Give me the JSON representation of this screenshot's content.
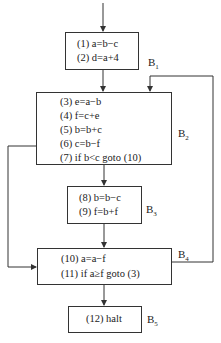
{
  "diagram": {
    "type": "control-flow-graph",
    "blocks": [
      {
        "id": "B1",
        "label": "B",
        "sub": "1",
        "statements": [
          "(1) a=b−c",
          "(2) d=a+4"
        ]
      },
      {
        "id": "B2",
        "label": "B",
        "sub": "2",
        "statements": [
          "(3) e=a−b",
          "(4) f=c+e",
          "(5) b=b+c",
          "(6) c=b−f",
          "(7) if b<c goto (10)"
        ]
      },
      {
        "id": "B3",
        "label": "B",
        "sub": "3",
        "statements": [
          "(8) b=b−c",
          "(9) f=b+f"
        ]
      },
      {
        "id": "B4",
        "label": "B",
        "sub": "4",
        "statements": [
          "(10) a=a−f",
          "(11) if a≥f  goto (3)"
        ]
      },
      {
        "id": "B5",
        "label": "B",
        "sub": "5",
        "statements": [
          "(12) halt"
        ]
      }
    ],
    "edges": [
      {
        "from": "entry",
        "to": "B1"
      },
      {
        "from": "B1",
        "to": "B2"
      },
      {
        "from": "B2",
        "to": "B3"
      },
      {
        "from": "B2",
        "to": "B4"
      },
      {
        "from": "B3",
        "to": "B4"
      },
      {
        "from": "B4",
        "to": "B2"
      },
      {
        "from": "B4",
        "to": "B5"
      }
    ],
    "colors": {
      "line": "#333333",
      "background": "#ffffff"
    }
  }
}
